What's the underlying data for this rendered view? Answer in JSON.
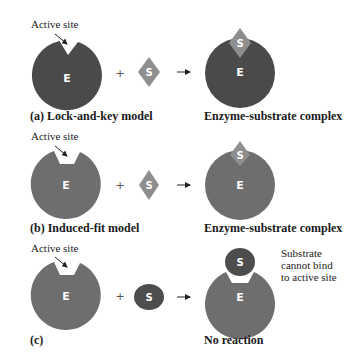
{
  "colors": {
    "enzyme_dark": "#4a4a4a",
    "enzyme_medium": "#6e6e6e",
    "substrate_diamond": "#8e8e8e",
    "substrate_dark_circle": "#4d4d4d",
    "background": "#ffffff",
    "letter": "#ffffff"
  },
  "labels": {
    "enzyme_letter": "E",
    "substrate_letter": "S",
    "plus": "+",
    "arrow": "→"
  },
  "rows": [
    {
      "id": "a",
      "active_site_label": "Active site",
      "caption_left": "(a) Lock-and-key model",
      "caption_right": "Enzyme-substrate complex",
      "substrate_shape": "diamond",
      "active_site_shape": "v-notch"
    },
    {
      "id": "b",
      "active_site_label": "Active site",
      "caption_left": "(b) Induced-fit model",
      "caption_right": "Enzyme-substrate complex",
      "substrate_shape": "diamond",
      "active_site_shape": "trapezoid-notch"
    },
    {
      "id": "c",
      "active_site_label": "Active site",
      "caption_left": "(c)",
      "caption_right": "No reaction",
      "substrate_shape": "circle",
      "active_site_shape": "trapezoid-notch",
      "note": [
        "Substrate",
        "cannot bind",
        "to active site"
      ]
    }
  ]
}
